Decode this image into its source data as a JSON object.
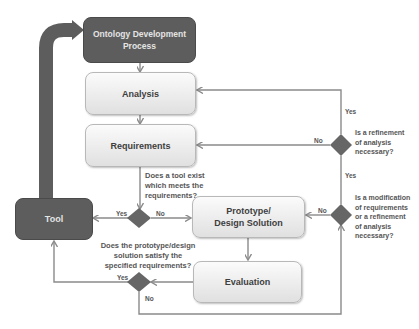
{
  "nodes": {
    "ontology": "Ontology Development Process",
    "analysis": "Analysis",
    "requirements": "Requirements",
    "tool": "Tool",
    "prototype_line1": "Prototype/",
    "prototype_line2": "Design Solution",
    "evaluation": "Evaluation"
  },
  "decisions": {
    "refinement": {
      "question_lines": [
        "Is a refinement",
        "of analysis",
        "necessary?"
      ],
      "yes": "Yes",
      "no": "No"
    },
    "modification": {
      "question_lines": [
        "Is a modification",
        "of requirements",
        "or a refinement",
        "of analysis",
        "necessary?"
      ],
      "yes": "Yes",
      "no": "No"
    },
    "tool_exists": {
      "question_lines": [
        "Does a tool exist",
        "which meets the",
        "requirements?"
      ],
      "yes": "Yes",
      "no": "No"
    },
    "satisfy": {
      "question_lines": [
        "Does the prototype/design",
        "solution satisfy the",
        "specified requirements?"
      ],
      "yes": "Yes",
      "no": "No"
    }
  },
  "colors": {
    "dark_node": "#5d5d5d",
    "light_node": "#ececec",
    "diamond": "#666666",
    "connector": "#8a8a8a"
  }
}
